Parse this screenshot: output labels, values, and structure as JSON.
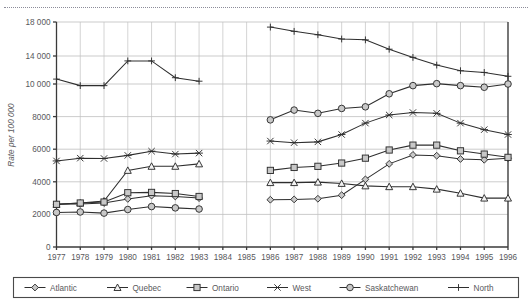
{
  "axis": {
    "ylabel": "Rate per 100 000",
    "yticks": [
      "0",
      "2000",
      "4000",
      "6000",
      "8000",
      "10 000",
      "14 000",
      "18 000"
    ],
    "ytick_values": [
      0,
      2000,
      4000,
      6000,
      8000,
      10000,
      14000,
      18000
    ],
    "xticks": [
      "1977",
      "1978",
      "1979",
      "1980",
      "1981",
      "1982",
      "1983",
      "1984",
      "1985",
      "1986",
      "1987",
      "1988",
      "1989",
      "1990",
      "1991",
      "1992",
      "1993",
      "1994",
      "1995",
      "1996"
    ]
  },
  "legend": {
    "items": [
      {
        "label": "Atlantic",
        "marker": "diamond-marker"
      },
      {
        "label": "Quebec",
        "marker": "triangle-marker"
      },
      {
        "label": "Ontario",
        "marker": "square-marker"
      },
      {
        "label": "West",
        "marker": "star-marker"
      },
      {
        "label": "Saskatchewan",
        "marker": "circle-marker"
      },
      {
        "label": "North",
        "marker": "plus-marker"
      }
    ]
  },
  "chart_data": {
    "type": "line",
    "title": "",
    "xlabel": "",
    "ylabel": "Rate per 100 000",
    "ylim": [
      0,
      18000
    ],
    "grid": true,
    "legend_position": "bottom",
    "x": [
      1977,
      1978,
      1979,
      1980,
      1981,
      1982,
      1983,
      1984,
      1985,
      1986,
      1987,
      1988,
      1989,
      1990,
      1991,
      1992,
      1993,
      1994,
      1995,
      1996
    ],
    "note": "Data missing for 1984 and 1985; y-axis is non-linear above 10 000",
    "series": [
      {
        "name": "Atlantic",
        "marker": "diamond-marker",
        "values": [
          2620,
          2640,
          2700,
          2950,
          3150,
          3100,
          3000,
          null,
          null,
          2900,
          2920,
          2960,
          3180,
          4150,
          5100,
          5650,
          5600,
          5400,
          5350,
          5450
        ]
      },
      {
        "name": "Quebec",
        "marker": "triangle-marker",
        "values": [
          2620,
          2700,
          2820,
          4700,
          4950,
          4950,
          5100,
          null,
          null,
          3950,
          3950,
          3980,
          3900,
          3750,
          3700,
          3700,
          3550,
          3300,
          3000,
          3000
        ]
      },
      {
        "name": "Ontario",
        "marker": "square-marker",
        "values": [
          2620,
          2700,
          2760,
          3330,
          3350,
          3280,
          3100,
          null,
          null,
          4700,
          4880,
          4950,
          5150,
          5450,
          5950,
          6250,
          6250,
          5900,
          5700,
          5500
        ]
      },
      {
        "name": "West",
        "marker": "star-marker",
        "values": [
          5280,
          5450,
          5430,
          5620,
          5880,
          5700,
          5760,
          null,
          null,
          6500,
          6400,
          6450,
          6900,
          7600,
          8100,
          8250,
          8200,
          7600,
          7200,
          6900
        ]
      },
      {
        "name": "Saskatchewan",
        "marker": "circle-marker",
        "values": [
          2120,
          2150,
          2080,
          2300,
          2480,
          2400,
          2330,
          null,
          null,
          7800,
          8400,
          8200,
          8500,
          8600,
          9400,
          9900,
          10050,
          9900,
          9800,
          10000
        ]
      },
      {
        "name": "North",
        "marker": "plus-marker",
        "values": [
          10700,
          9900,
          9900,
          13300,
          13300,
          10900,
          10400,
          null,
          null,
          17400,
          16900,
          16500,
          16000,
          15900,
          14800,
          13800,
          12700,
          11900,
          11650,
          11100
        ]
      }
    ]
  }
}
